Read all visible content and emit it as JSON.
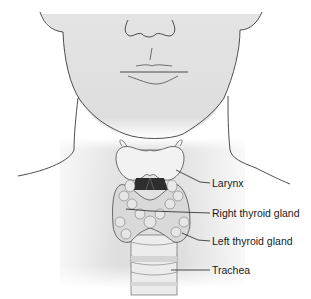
{
  "diagram": {
    "labels": [
      {
        "id": "larynx",
        "text": "Larynx"
      },
      {
        "id": "right-thyroid",
        "text": "Right thyroid gland"
      },
      {
        "id": "left-thyroid",
        "text": "Left thyroid gland"
      },
      {
        "id": "trachea",
        "text": "Trachea"
      }
    ],
    "colors": {
      "skin_shade": "#dcdcdc",
      "outline": "#3a3a3a",
      "cartilage": "#f2f2f2",
      "gland": "#d9d9d9",
      "dark_airway": "#2e2e2e",
      "leader_line": "#222222"
    }
  }
}
